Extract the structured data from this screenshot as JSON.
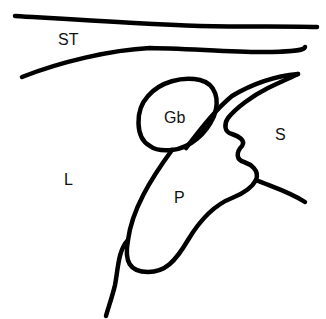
{
  "diagram": {
    "type": "anatomical line drawing",
    "labels": {
      "st": "ST",
      "gb": "Gb",
      "s": "S",
      "l": "L",
      "p": "P"
    },
    "colors": {
      "line": "#000000",
      "background": "#ffffff",
      "text": "#111111"
    }
  }
}
